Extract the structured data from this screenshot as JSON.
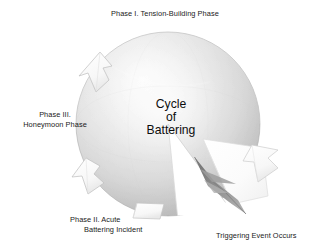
{
  "figure": {
    "type": "cycle-diagram",
    "background_color": "#ffffff",
    "center_label": {
      "line1": "Cycle",
      "line2": "of",
      "line3": "Battering"
    },
    "sphere": {
      "center_x": 168,
      "center_y": 124,
      "radius": 92,
      "fill_light": "#f2f2f2",
      "fill_mid": "#d3d3d3",
      "fill_dark": "#a9a9a9",
      "edge_color": "#9a9a9a"
    },
    "wedge": {
      "name": "triggering-event-wedge",
      "start_angle_deg": 58,
      "end_angle_deg": 96,
      "fill": "#ffffff"
    },
    "needle": {
      "name": "triggering-event-needle",
      "color": "#8a8a8a",
      "tip_x": 196,
      "tip_y": 159,
      "tail_x": 244,
      "tail_y": 219
    },
    "arrow_markers": [
      {
        "name": "arrow-phase1-to-phase3",
        "angle_deg": 152,
        "fill": "#fbfbfb",
        "stroke": "#b8b8b8"
      },
      {
        "name": "arrow-phase3-to-phase2",
        "angle_deg": 212,
        "fill": "#fbfbfb",
        "stroke": "#b8b8b8"
      },
      {
        "name": "arrow-phase2-bottom",
        "angle_deg": 272,
        "fill": "#fdfdfd",
        "stroke": "#bdbdbd"
      },
      {
        "name": "arrow-right-edge",
        "angle_deg": 20,
        "fill": "#fdfdfd",
        "stroke": "#c8c8c8"
      }
    ]
  },
  "labels": {
    "phase1": "Phase I. Tension-Building Phase",
    "phase3": {
      "line1": "Phase III.",
      "line2": "Honeymoon Phase"
    },
    "phase2": {
      "line1": "Phase II. Acute",
      "line2": "Battering Incident"
    },
    "trigger": "Triggering Event Occurs"
  },
  "colors": {
    "text": "#1a1a1a",
    "center_text": "#0d0d0d",
    "background": "#ffffff",
    "sphere_mid": "#d3d3d3",
    "needle": "#8a8a8a"
  }
}
